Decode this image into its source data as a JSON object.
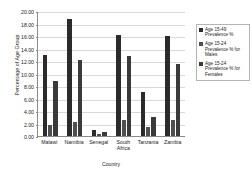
{
  "chart_data": {
    "type": "bar",
    "title": "",
    "xlabel": "Country",
    "ylabel": "Percentage of Age Group",
    "categories": [
      "Malawi",
      "Namibia",
      "Senegal",
      "South Africa",
      "Tanzania",
      "Zambia"
    ],
    "series": [
      {
        "name": "Age 15-49 Prevalence %",
        "color": "#2b2b2b",
        "values": [
          13.0,
          18.8,
          0.9,
          16.2,
          7.0,
          16.0
        ]
      },
      {
        "name": "Age 15-24 Prevalence % for Males",
        "color": "#4f4f4f",
        "values": [
          1.8,
          2.3,
          0.3,
          2.6,
          1.5,
          2.5
        ]
      },
      {
        "name": "Age 15-24 Prevalence % for Females",
        "color": "#3a3a3a",
        "values": [
          8.8,
          12.2,
          0.6,
          12.8,
          3.0,
          11.5
        ]
      }
    ],
    "ylim": [
      0.0,
      20.0
    ],
    "ytick_step": 2.0,
    "yticks": [
      "0.00",
      "2.00",
      "4.00",
      "6.00",
      "8.00",
      "10.00",
      "12.00",
      "14.00",
      "16.00",
      "18.00",
      "20.00"
    ],
    "grid": true,
    "legend_position": "right"
  }
}
